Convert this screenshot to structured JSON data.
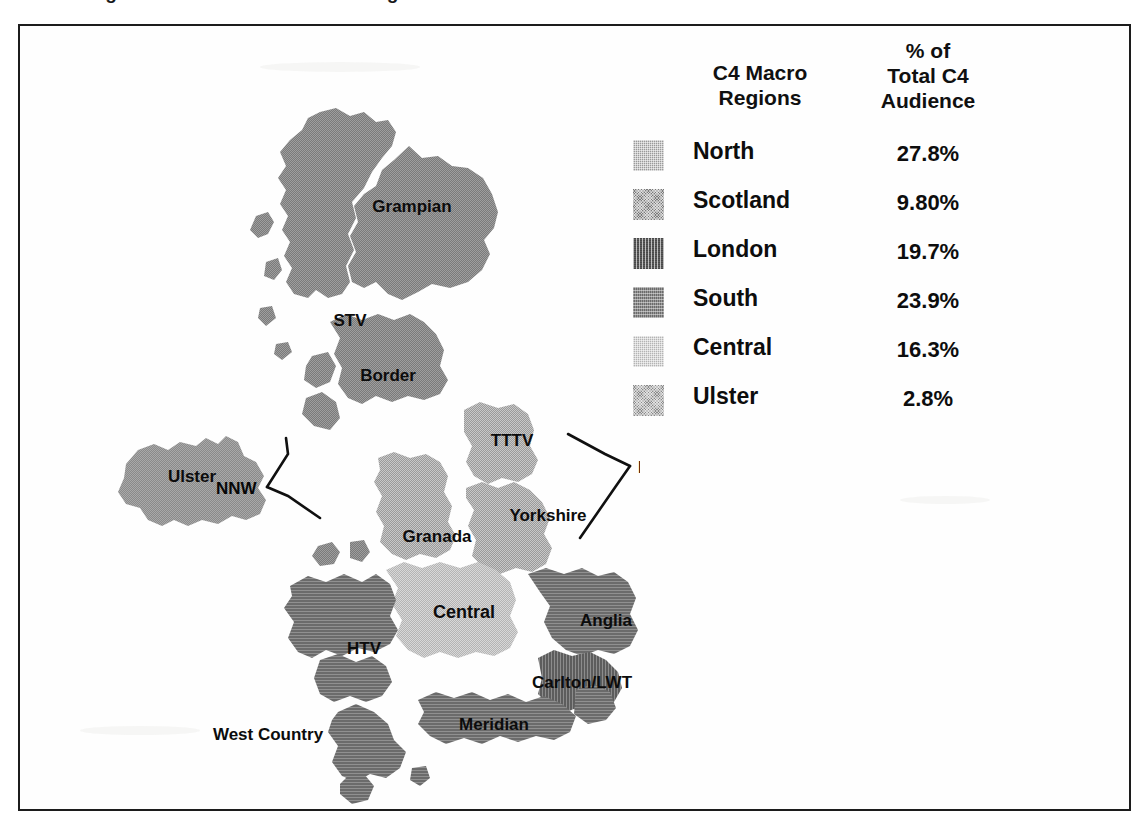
{
  "figure": {
    "caption": "Figure 3.3.1    Channel 4 Macro Regions",
    "caption_visible_note": "cropped"
  },
  "legend": {
    "header_regions": "C4 Macro\nRegions",
    "header_regions_line1": "C4 Macro",
    "header_regions_line2": "Regions",
    "header_percent_line1": "% of",
    "header_percent_line2": "Total C4",
    "header_percent_line3": "Audience",
    "rows": [
      {
        "label": "North",
        "value": "27.8%",
        "swatch": "check",
        "color": "#9a9a9a"
      },
      {
        "label": "Scotland",
        "value": "9.80%",
        "swatch": "dot",
        "color": "#7a7a7a"
      },
      {
        "label": "London",
        "value": "19.7%",
        "swatch": "vstripe",
        "color": "#5d5d5d"
      },
      {
        "label": "South",
        "value": "23.9%",
        "swatch": "hstripe",
        "color": "#6b6b6b"
      },
      {
        "label": "Central",
        "value": "16.3%",
        "swatch": "check",
        "color": "#b4b4b4"
      },
      {
        "label": "Ulster",
        "value": "2.8%",
        "swatch": "dot",
        "color": "#8a8a8a"
      }
    ]
  },
  "map": {
    "region_labels": [
      {
        "name": "Grampian",
        "x": 222,
        "y": 181,
        "size": 17
      },
      {
        "name": "STV",
        "x": 196,
        "y": 291,
        "size": 17
      },
      {
        "name": "Border",
        "x": 250,
        "y": 347,
        "size": 17
      },
      {
        "name": "Ulster",
        "x": 78,
        "y": 443,
        "size": 17
      },
      {
        "name": "TTTV",
        "x": 498,
        "y": 413,
        "size": 17
      },
      {
        "name": "Yorkshire",
        "x": 531,
        "y": 485,
        "size": 17
      },
      {
        "name": "Granada",
        "x": 425,
        "y": 505,
        "size": 17
      },
      {
        "name": "Central",
        "x": 455,
        "y": 581,
        "size": 18
      },
      {
        "name": "Anglia",
        "x": 598,
        "y": 593,
        "size": 17
      },
      {
        "name": "HTV",
        "x": 356,
        "y": 622,
        "size": 17
      },
      {
        "name": "Carlton/LWT",
        "x": 570,
        "y": 655,
        "size": 17
      },
      {
        "name": "Meridian",
        "x": 485,
        "y": 697,
        "size": 17
      },
      {
        "name": "West Country",
        "x": 250,
        "y": 708,
        "size": 17
      }
    ],
    "callouts": [
      {
        "name": "NNW",
        "x": 353,
        "y": 455
      },
      {
        "name": "North",
        "x": 634,
        "y": 435
      }
    ]
  },
  "colors": {
    "ink": "#0d0d0d",
    "frame": "#1c1c1c",
    "paper": "#fefefe",
    "region_north": "#9a9a9a",
    "region_scotland": "#7a7a7a",
    "region_london": "#5d5d5d",
    "region_south": "#6b6b6b",
    "region_central": "#b4b4b4",
    "region_ulster": "#8a8a8a"
  }
}
